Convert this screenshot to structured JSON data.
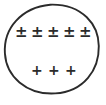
{
  "figure": {
    "background_color": "#ffffff",
    "ink_color": "#2b2b2b",
    "canvas": {
      "width": 106,
      "height": 105
    },
    "shape": {
      "kind": "circle",
      "style": "hand-drawn",
      "center_x": 52,
      "center_y": 52,
      "radius_x": 46,
      "radius_y": 47,
      "stroke_color": "#2b2b2b",
      "stroke_width": 1.8,
      "fill": "none"
    },
    "rows": [
      {
        "id": "top-row",
        "symbol_name": "plus-minus-sign",
        "glyph": "±",
        "count": 5,
        "symbols": [
          "±",
          "±",
          "±",
          "±",
          "±"
        ],
        "center_y": 33
      },
      {
        "id": "bottom-row",
        "symbol_name": "plus-sign",
        "glyph": "+",
        "count": 3,
        "symbols": [
          "+",
          "+",
          "+"
        ],
        "center_y": 70
      }
    ]
  }
}
